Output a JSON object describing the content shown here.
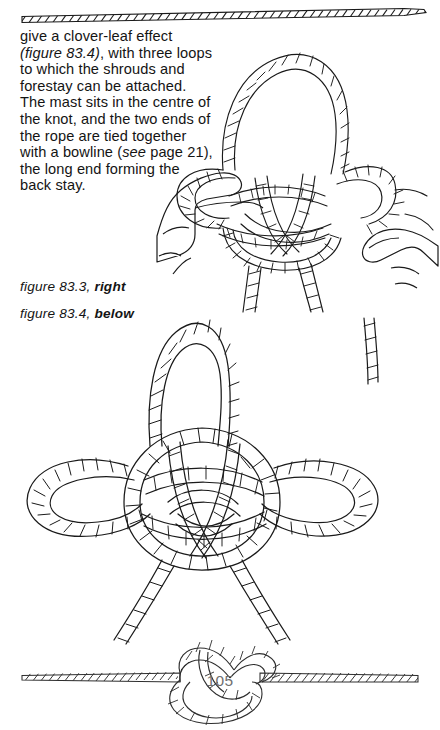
{
  "page": {
    "folio": "105",
    "folio_color": "#6f6f6f",
    "background": "#ffffff",
    "ink": "#141414"
  },
  "top_rule": {
    "icon": "rope-divider-icon",
    "description": "horizontal twisted rope rule across top of page with tapered end at right"
  },
  "body": {
    "line1": "give a clover-leaf effect",
    "line2_italic": "(figure 83.4)",
    "line2_rest": ", with three loops",
    "line3": "to which the shrouds and",
    "line4": "forestay can be attached.",
    "line5": "The mast sits in the centre of",
    "line6": "the knot, and the two ends of",
    "line7": "the rope are tied together",
    "line8_pre": "with a bowline (",
    "line8_italic": "see",
    "line8_post": " page 21),",
    "line9": "the long end forming the",
    "line10": "back stay."
  },
  "captions": [
    {
      "text": "figure 83.3, ",
      "emphasis": "right"
    },
    {
      "text": "figure 83.4, ",
      "emphasis": "below"
    }
  ],
  "figures": [
    {
      "id": "figure-83-3",
      "icon": "hands-tying-knot-illustration",
      "label": "figure 83.3",
      "placement": "right",
      "description": "Two hands holding a partly formed mast-head knot with a large bight rising above and two rope tails below"
    },
    {
      "id": "figure-83-4",
      "icon": "clover-leaf-knot-illustration",
      "label": "figure 83.4",
      "placement": "below",
      "description": "Finished three-loop clover-leaf mast-head knot with upper bight, left and right loops and two descending ends"
    }
  ],
  "footer": {
    "icon": "overhand-knot-rope-icon",
    "description": "horizontal rope running the page width with an overhand knot at centre enclosing the page number"
  }
}
